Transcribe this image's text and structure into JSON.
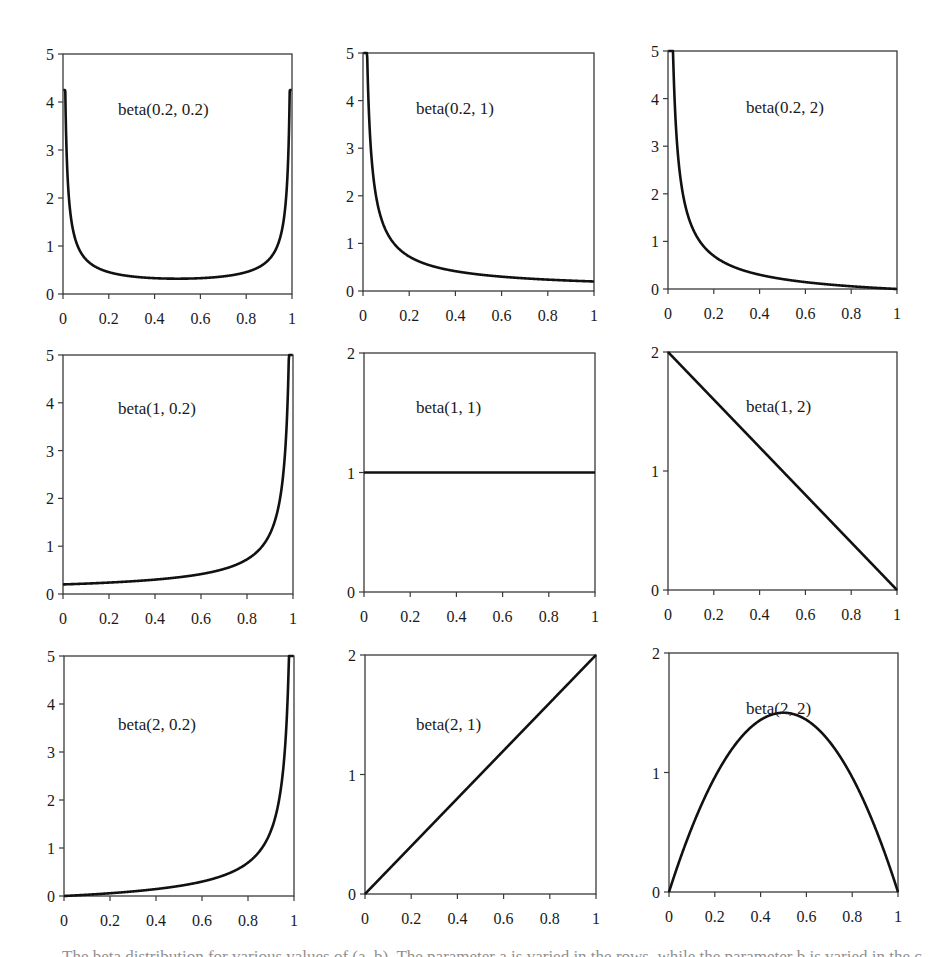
{
  "figure": {
    "caption": "The beta distribution for various values of (a, b). The parameter a is varied in the rows, while the parameter b is varied in the columns."
  },
  "chart_data": [
    {
      "type": "line",
      "title": "beta(0.2, 0.2)",
      "params": {
        "a": 0.2,
        "b": 0.2
      },
      "xlim": [
        0,
        1
      ],
      "ylim": [
        0,
        5
      ],
      "xticks": [
        "0",
        "0.2",
        "0.4",
        "0.6",
        "0.8",
        "1"
      ],
      "yticks": [
        "0",
        "1",
        "2",
        "3",
        "4",
        "5"
      ],
      "x": [
        0.01,
        0.1,
        0.2,
        0.3,
        0.4,
        0.5,
        0.6,
        0.7,
        0.8,
        0.9,
        0.99
      ],
      "values": [
        4.2,
        0.72,
        0.46,
        0.37,
        0.33,
        0.32,
        0.33,
        0.37,
        0.46,
        0.72,
        4.2
      ],
      "xlabel": "",
      "ylabel": "",
      "grid": false
    },
    {
      "type": "line",
      "title": "beta(0.2, 1)",
      "params": {
        "a": 0.2,
        "b": 1
      },
      "xlim": [
        0,
        1
      ],
      "ylim": [
        0,
        5
      ],
      "xticks": [
        "0",
        "0.2",
        "0.4",
        "0.6",
        "0.8",
        "1"
      ],
      "yticks": [
        "0",
        "1",
        "2",
        "3",
        "4",
        "5"
      ],
      "x": [
        0.02,
        0.1,
        0.2,
        0.3,
        0.4,
        0.5,
        0.6,
        0.7,
        0.8,
        0.9,
        1.0
      ],
      "values": [
        5.0,
        1.26,
        0.72,
        0.52,
        0.42,
        0.35,
        0.3,
        0.27,
        0.24,
        0.22,
        0.2
      ],
      "xlabel": "",
      "ylabel": "",
      "grid": false
    },
    {
      "type": "line",
      "title": "beta(0.2, 2)",
      "params": {
        "a": 0.2,
        "b": 2
      },
      "xlim": [
        0,
        1
      ],
      "ylim": [
        0,
        5
      ],
      "xticks": [
        "0",
        "0.2",
        "0.4",
        "0.6",
        "0.8",
        "1"
      ],
      "yticks": [
        "0",
        "1",
        "2",
        "3",
        "4",
        "5"
      ],
      "x": [
        0.02,
        0.1,
        0.2,
        0.3,
        0.4,
        0.5,
        0.6,
        0.7,
        0.8,
        0.9,
        1.0
      ],
      "values": [
        5.0,
        1.36,
        0.7,
        0.44,
        0.3,
        0.21,
        0.14,
        0.09,
        0.05,
        0.02,
        0.0
      ],
      "xlabel": "",
      "ylabel": "",
      "grid": false
    },
    {
      "type": "line",
      "title": "beta(1, 0.2)",
      "params": {
        "a": 1,
        "b": 0.2
      },
      "xlim": [
        0,
        1
      ],
      "ylim": [
        0,
        5
      ],
      "xticks": [
        "0",
        "0.2",
        "0.4",
        "0.6",
        "0.8",
        "1"
      ],
      "yticks": [
        "0",
        "1",
        "2",
        "3",
        "4",
        "5"
      ],
      "x": [
        0.0,
        0.1,
        0.2,
        0.3,
        0.4,
        0.5,
        0.6,
        0.7,
        0.8,
        0.9,
        0.98
      ],
      "values": [
        0.2,
        0.22,
        0.24,
        0.27,
        0.3,
        0.35,
        0.42,
        0.52,
        0.72,
        1.26,
        5.0
      ],
      "xlabel": "",
      "ylabel": "",
      "grid": false
    },
    {
      "type": "line",
      "title": "beta(1, 1)",
      "params": {
        "a": 1,
        "b": 1
      },
      "xlim": [
        0,
        1
      ],
      "ylim": [
        0,
        2
      ],
      "xticks": [
        "0",
        "0.2",
        "0.4",
        "0.6",
        "0.8",
        "1"
      ],
      "yticks": [
        "0",
        "1",
        "2"
      ],
      "x": [
        0.0,
        0.2,
        0.4,
        0.6,
        0.8,
        1.0
      ],
      "values": [
        1,
        1,
        1,
        1,
        1,
        1
      ],
      "xlabel": "",
      "ylabel": "",
      "grid": false
    },
    {
      "type": "line",
      "title": "beta(1, 2)",
      "params": {
        "a": 1,
        "b": 2
      },
      "xlim": [
        0,
        1
      ],
      "ylim": [
        0,
        2
      ],
      "xticks": [
        "0",
        "0.2",
        "0.4",
        "0.6",
        "0.8",
        "1"
      ],
      "yticks": [
        "0",
        "1",
        "2"
      ],
      "x": [
        0.0,
        0.2,
        0.4,
        0.6,
        0.8,
        1.0
      ],
      "values": [
        2.0,
        1.6,
        1.2,
        0.8,
        0.4,
        0.0
      ],
      "xlabel": "",
      "ylabel": "",
      "grid": false
    },
    {
      "type": "line",
      "title": "beta(2, 0.2)",
      "params": {
        "a": 2,
        "b": 0.2
      },
      "xlim": [
        0,
        1
      ],
      "ylim": [
        0,
        5
      ],
      "xticks": [
        "0",
        "0.2",
        "0.4",
        "0.6",
        "0.8",
        "1"
      ],
      "yticks": [
        "0",
        "1",
        "2",
        "3",
        "4",
        "5"
      ],
      "x": [
        0.0,
        0.1,
        0.2,
        0.3,
        0.4,
        0.5,
        0.6,
        0.7,
        0.8,
        0.9,
        0.98
      ],
      "values": [
        0.0,
        0.02,
        0.05,
        0.09,
        0.14,
        0.21,
        0.3,
        0.44,
        0.7,
        1.36,
        5.0
      ],
      "xlabel": "",
      "ylabel": "",
      "grid": false
    },
    {
      "type": "line",
      "title": "beta(2, 1)",
      "params": {
        "a": 2,
        "b": 1
      },
      "xlim": [
        0,
        1
      ],
      "ylim": [
        0,
        2
      ],
      "xticks": [
        "0",
        "0.2",
        "0.4",
        "0.6",
        "0.8",
        "1"
      ],
      "yticks": [
        "0",
        "1",
        "2"
      ],
      "x": [
        0.0,
        0.2,
        0.4,
        0.6,
        0.8,
        1.0
      ],
      "values": [
        0.0,
        0.4,
        0.8,
        1.2,
        1.6,
        2.0
      ],
      "xlabel": "",
      "ylabel": "",
      "grid": false
    },
    {
      "type": "line",
      "title": "beta(2, 2)",
      "params": {
        "a": 2,
        "b": 2
      },
      "xlim": [
        0,
        1
      ],
      "ylim": [
        0,
        2
      ],
      "xticks": [
        "0",
        "0.2",
        "0.4",
        "0.6",
        "0.8",
        "1"
      ],
      "yticks": [
        "0",
        "1",
        "2"
      ],
      "x": [
        0.0,
        0.1,
        0.2,
        0.3,
        0.4,
        0.5,
        0.6,
        0.7,
        0.8,
        0.9,
        1.0
      ],
      "values": [
        0.0,
        0.54,
        0.96,
        1.26,
        1.44,
        1.5,
        1.44,
        1.26,
        0.96,
        0.54,
        0.0
      ],
      "xlabel": "",
      "ylabel": "",
      "grid": false
    }
  ]
}
